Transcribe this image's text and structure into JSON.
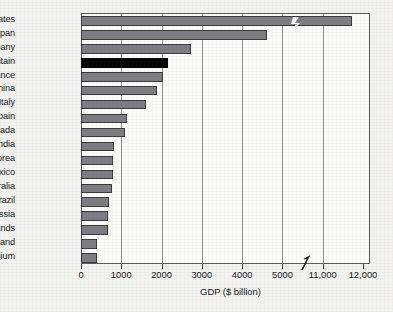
{
  "chart_data": {
    "type": "bar",
    "orientation": "horizontal",
    "title": "",
    "xlabel": "GDP ($ billion)",
    "ylabel": "",
    "categories": [
      "United States",
      "Japan",
      "Germany",
      "Britain",
      "France",
      "China",
      "Italy",
      "Spain",
      "Canada",
      "India",
      "South Korea",
      "Mexico",
      "Australia",
      "Brazil",
      "Russia",
      "Netherlands",
      "Switzerland",
      "Belgium"
    ],
    "values": [
      11700,
      4600,
      2700,
      2140,
      2000,
      1850,
      1600,
      1120,
      1060,
      790,
      760,
      760,
      740,
      660,
      640,
      640,
      370,
      370
    ],
    "highlight_category": "Britain",
    "highlight_color": "#050505",
    "bar_color": "#7d7d82",
    "axis_break": {
      "from": 5000,
      "to": 11000
    },
    "xticks": [
      "0",
      "1000",
      "2000",
      "3000",
      "4000",
      "5000",
      "11,000",
      "12,000"
    ],
    "xtick_values": [
      0,
      1000,
      2000,
      3000,
      4000,
      5000,
      11000,
      12000
    ],
    "gridlines": [
      1000,
      2000,
      3000,
      4000,
      5000,
      11000
    ],
    "grid": true,
    "legend": "none",
    "xlim": [
      0,
      12000
    ]
  }
}
